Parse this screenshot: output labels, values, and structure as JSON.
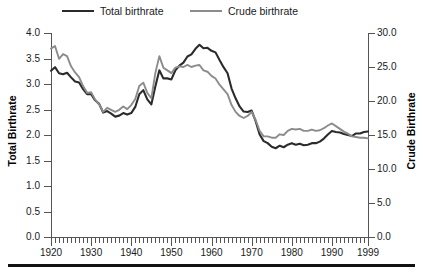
{
  "legend": {
    "items": [
      {
        "label": "Total birthrate",
        "color": "#2b2b2b",
        "key": "total"
      },
      {
        "label": "Crude birthrate",
        "color": "#8c8c8c",
        "key": "crude"
      }
    ]
  },
  "axes": {
    "left_title": "Total Birthrate",
    "right_title": "Crude Birthrate",
    "left_ticks": [
      "0.0",
      "0.5",
      "1.0",
      "1.5",
      "2.0",
      "2.5",
      "3.0",
      "3.5",
      "4.0"
    ],
    "right_ticks": [
      "0.0",
      "5.0",
      "10.0",
      "15.0",
      "20.0",
      "25.0",
      "30.0"
    ],
    "x_ticks": [
      "1920",
      "1930",
      "1940",
      "1950",
      "1960",
      "1970",
      "1980",
      "1990",
      "1999"
    ]
  },
  "chart_data": {
    "type": "line",
    "title": "",
    "xlabel": "",
    "ylabel": "Total Birthrate",
    "y2label": "Crude Birthrate",
    "xlim": [
      1920,
      1999
    ],
    "ylim": [
      0.0,
      4.0
    ],
    "y2lim": [
      0.0,
      30.0
    ],
    "grid": false,
    "legend_position": "top",
    "x": [
      1920,
      1921,
      1922,
      1923,
      1924,
      1925,
      1926,
      1927,
      1928,
      1929,
      1930,
      1931,
      1932,
      1933,
      1934,
      1935,
      1936,
      1937,
      1938,
      1939,
      1940,
      1941,
      1942,
      1943,
      1944,
      1945,
      1946,
      1947,
      1948,
      1949,
      1950,
      1951,
      1952,
      1953,
      1954,
      1955,
      1956,
      1957,
      1958,
      1959,
      1960,
      1961,
      1962,
      1963,
      1964,
      1965,
      1966,
      1967,
      1968,
      1969,
      1970,
      1971,
      1972,
      1973,
      1974,
      1975,
      1976,
      1977,
      1978,
      1979,
      1980,
      1981,
      1982,
      1983,
      1984,
      1985,
      1986,
      1987,
      1988,
      1989,
      1990,
      1991,
      1992,
      1993,
      1994,
      1995,
      1996,
      1997,
      1998,
      1999
    ],
    "series": [
      {
        "name": "Total birthrate",
        "color": "#2b2b2b",
        "axis": "left",
        "values": [
          3.26,
          3.33,
          3.21,
          3.19,
          3.22,
          3.13,
          3.05,
          3.03,
          2.9,
          2.8,
          2.8,
          2.68,
          2.61,
          2.44,
          2.47,
          2.42,
          2.36,
          2.38,
          2.43,
          2.4,
          2.43,
          2.55,
          2.8,
          2.88,
          2.7,
          2.6,
          2.95,
          3.27,
          3.11,
          3.11,
          3.09,
          3.27,
          3.36,
          3.42,
          3.54,
          3.58,
          3.69,
          3.77,
          3.7,
          3.71,
          3.65,
          3.62,
          3.47,
          3.33,
          3.21,
          2.91,
          2.72,
          2.56,
          2.46,
          2.45,
          2.48,
          2.27,
          2.01,
          1.88,
          1.84,
          1.77,
          1.74,
          1.79,
          1.76,
          1.81,
          1.84,
          1.81,
          1.83,
          1.8,
          1.81,
          1.84,
          1.84,
          1.87,
          1.93,
          2.01,
          2.08,
          2.06,
          2.05,
          2.02,
          2.0,
          1.98,
          2.03,
          2.03,
          2.06,
          2.07
        ]
      },
      {
        "name": "Crude birthrate",
        "color": "#8c8c8c",
        "axis": "right",
        "values": [
          27.7,
          28.1,
          26.2,
          26.9,
          26.6,
          25.1,
          24.2,
          23.5,
          22.2,
          21.2,
          21.3,
          20.2,
          19.5,
          18.4,
          19.0,
          18.7,
          18.4,
          18.7,
          19.2,
          18.8,
          19.4,
          20.3,
          22.2,
          22.7,
          21.2,
          20.4,
          24.1,
          26.6,
          24.9,
          24.5,
          24.1,
          24.9,
          25.1,
          25.0,
          25.3,
          25.0,
          25.2,
          25.3,
          24.5,
          24.3,
          23.7,
          23.3,
          22.4,
          21.7,
          21.0,
          19.4,
          18.4,
          17.8,
          17.5,
          17.8,
          18.4,
          17.2,
          15.6,
          14.8,
          14.8,
          14.6,
          14.6,
          15.1,
          15.0,
          15.6,
          15.9,
          15.8,
          15.9,
          15.6,
          15.6,
          15.8,
          15.6,
          15.7,
          16.0,
          16.4,
          16.7,
          16.3,
          15.9,
          15.5,
          15.2,
          14.8,
          14.7,
          14.6,
          14.6,
          14.5
        ]
      }
    ]
  }
}
